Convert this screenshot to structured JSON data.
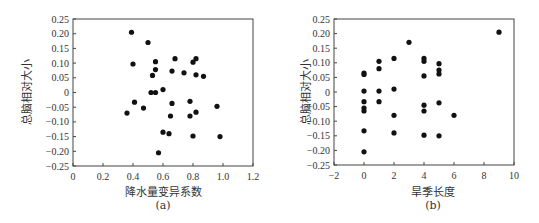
{
  "chart_data": [
    {
      "id": "a",
      "type": "scatter",
      "title": "",
      "caption": "(a)",
      "xlabel": "降水量变异系数",
      "ylabel": "总脑相对大小",
      "xlim": [
        0,
        1.2
      ],
      "ylim": [
        -0.25,
        0.25
      ],
      "xticks": [
        0,
        0.2,
        0.4,
        0.6,
        0.8,
        1.0,
        1.2
      ],
      "xtick_labels": [
        "0",
        "0.2",
        "0.4",
        "0.6",
        "0.8",
        "1.0",
        "1.2"
      ],
      "yticks": [
        0.25,
        0.2,
        0.15,
        0.1,
        0.05,
        0,
        -0.05,
        -0.1,
        -0.15,
        -0.2,
        -0.25
      ],
      "ytick_labels": [
        "0.25",
        "0.20",
        "0.15",
        "0.10",
        "0.05",
        "0",
        "−0.05",
        "−0.10",
        "−0.15",
        "−0.20",
        "−0.25"
      ],
      "grid": false,
      "legend": null,
      "marker_color": "#111111",
      "points": [
        [
          0.39,
          0.205
        ],
        [
          0.5,
          0.17
        ],
        [
          0.55,
          0.105
        ],
        [
          0.4,
          0.097
        ],
        [
          0.68,
          0.115
        ],
        [
          0.82,
          0.115
        ],
        [
          0.8,
          0.103
        ],
        [
          0.55,
          0.078
        ],
        [
          0.66,
          0.073
        ],
        [
          0.74,
          0.067
        ],
        [
          0.53,
          0.058
        ],
        [
          0.82,
          0.06
        ],
        [
          0.87,
          0.055
        ],
        [
          0.6,
          0.01
        ],
        [
          0.52,
          0.0
        ],
        [
          0.55,
          0.0
        ],
        [
          0.41,
          -0.033
        ],
        [
          0.78,
          -0.03
        ],
        [
          0.66,
          -0.037
        ],
        [
          0.47,
          -0.053
        ],
        [
          0.96,
          -0.047
        ],
        [
          0.36,
          -0.07
        ],
        [
          0.65,
          -0.08
        ],
        [
          0.78,
          -0.08
        ],
        [
          0.82,
          -0.067
        ],
        [
          0.6,
          -0.135
        ],
        [
          0.64,
          -0.14
        ],
        [
          0.8,
          -0.148
        ],
        [
          0.98,
          -0.15
        ],
        [
          0.57,
          -0.205
        ]
      ]
    },
    {
      "id": "b",
      "type": "scatter",
      "title": "",
      "caption": "(b)",
      "xlabel": "旱季长度",
      "ylabel": "总脑相对大小",
      "xlim": [
        -2,
        10
      ],
      "ylim": [
        -0.25,
        0.25
      ],
      "xticks": [
        -2,
        0,
        2,
        4,
        6,
        8,
        10
      ],
      "xtick_labels": [
        "−2",
        "0",
        "2",
        "4",
        "6",
        "8",
        "10"
      ],
      "yticks": [
        0.25,
        0.2,
        0.15,
        0.1,
        0.05,
        0,
        -0.05,
        -0.1,
        -0.15,
        -0.2,
        -0.25
      ],
      "ytick_labels": [
        "0.25",
        "0.20",
        "0.15",
        "0.10",
        "0.05",
        "0",
        "−0.05",
        "−0.10",
        "−0.15",
        "−0.20",
        "−0.25"
      ],
      "grid": false,
      "legend": null,
      "marker_color": "#111111",
      "points": [
        [
          9,
          0.205
        ],
        [
          3,
          0.17
        ],
        [
          2,
          0.115
        ],
        [
          4,
          0.115
        ],
        [
          4,
          0.105
        ],
        [
          1,
          0.105
        ],
        [
          5,
          0.097
        ],
        [
          1,
          0.08
        ],
        [
          5,
          0.075
        ],
        [
          0,
          0.065
        ],
        [
          0,
          0.06
        ],
        [
          5,
          0.062
        ],
        [
          4,
          0.055
        ],
        [
          2,
          0.01
        ],
        [
          0,
          0.003
        ],
        [
          1,
          0.003
        ],
        [
          0,
          -0.033
        ],
        [
          1,
          -0.033
        ],
        [
          5,
          -0.037
        ],
        [
          4,
          -0.045
        ],
        [
          0,
          -0.055
        ],
        [
          0,
          -0.065
        ],
        [
          4,
          -0.065
        ],
        [
          2,
          -0.08
        ],
        [
          6,
          -0.08
        ],
        [
          0,
          -0.133
        ],
        [
          2,
          -0.14
        ],
        [
          4,
          -0.148
        ],
        [
          5,
          -0.15
        ],
        [
          0,
          -0.205
        ]
      ]
    }
  ],
  "figures": {
    "a": {
      "xlabel": "降水量变异系数",
      "ylabel": "总脑相对大小",
      "caption": "(a)"
    },
    "b": {
      "xlabel": "旱季长度",
      "ylabel": "总脑相对大小",
      "caption": "(b)"
    }
  }
}
